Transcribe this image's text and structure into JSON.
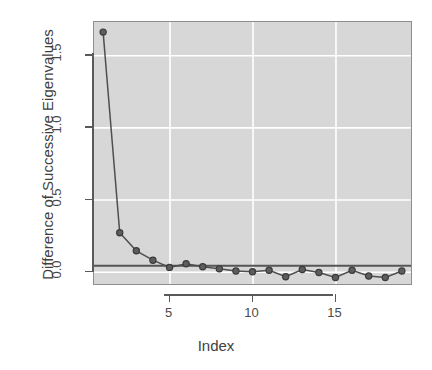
{
  "chart_data": {
    "type": "line",
    "title": "",
    "xlabel": "Index",
    "ylabel": "Difference of Successive Eigenvalues",
    "x": [
      1,
      2,
      3,
      4,
      5,
      6,
      7,
      8,
      9,
      10,
      11,
      12,
      13,
      14,
      15,
      16,
      17,
      18,
      19
    ],
    "values": [
      1.66,
      0.27,
      0.145,
      0.08,
      0.03,
      0.055,
      0.035,
      0.02,
      0.005,
      0.0,
      0.01,
      -0.035,
      0.015,
      -0.005,
      -0.04,
      0.01,
      -0.03,
      -0.04,
      0.005
    ],
    "series": [
      {
        "name": "Difference of Successive Eigenvalues",
        "values": [
          1.66,
          0.27,
          0.145,
          0.08,
          0.03,
          0.055,
          0.035,
          0.02,
          0.005,
          0.0,
          0.01,
          -0.035,
          0.015,
          -0.005,
          -0.04,
          0.01,
          -0.03,
          -0.04,
          0.005
        ]
      }
    ],
    "xlim": [
      0.45,
      19.55
    ],
    "ylim": [
      -0.085,
      1.73
    ],
    "xticks": [
      5,
      10,
      15
    ],
    "xticklabels": [
      "5",
      "10",
      "15"
    ],
    "yticks": [
      0.0,
      0.5,
      1.0,
      1.5
    ],
    "yticklabels": [
      "0.0",
      "0.5",
      "1.0",
      "1.5"
    ],
    "grid": true,
    "grid_color": "#ffffff",
    "panel_bg": "#d7d7d7",
    "legend": "none",
    "annotations": [
      {
        "kind": "hline",
        "y": 0.042,
        "color": "#555555",
        "label": "reference line"
      }
    ],
    "marker": "filled-circle",
    "marker_color": "#5d5d5d",
    "line_color": "#4f4f4f"
  },
  "axis": {
    "x_title": "Index",
    "y_title": "Difference of Successive Eigenvalues",
    "x_tick_labels": [
      "5",
      "10",
      "15"
    ],
    "y_tick_labels": [
      "0.0",
      "0.5",
      "1.0",
      "1.5"
    ]
  }
}
